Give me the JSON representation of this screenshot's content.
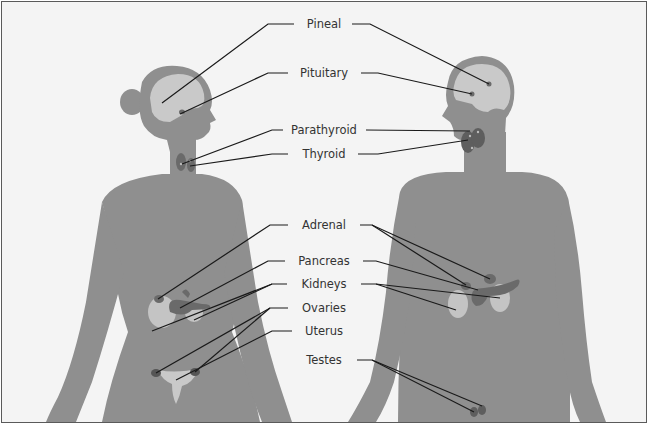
{
  "diagram": {
    "colors": {
      "background": "#f4f4f4",
      "body": "#8f8f8f",
      "brain": "#c9c9c9",
      "organ_dark": "#6a6a6a",
      "kidney": "#c4c4c4",
      "leader_line": "#1a1a1a",
      "label_text": "#333333",
      "border": "#5a5a5a"
    },
    "figures": [
      {
        "id": "female",
        "side": "left"
      },
      {
        "id": "male",
        "side": "right"
      }
    ],
    "labels": [
      {
        "id": "pineal",
        "text": "Pineal",
        "x": 322,
        "y": 21
      },
      {
        "id": "pituitary",
        "text": "Pituitary",
        "x": 322,
        "y": 70
      },
      {
        "id": "parathyroid",
        "text": "Parathyroid",
        "x": 322,
        "y": 122
      },
      {
        "id": "thyroid",
        "text": "Thyroid",
        "x": 322,
        "y": 145
      },
      {
        "id": "adrenal",
        "text": "Adrenal",
        "x": 322,
        "y": 217
      },
      {
        "id": "pancreas",
        "text": "Pancreas",
        "x": 322,
        "y": 252
      },
      {
        "id": "kidneys",
        "text": "Kidneys",
        "x": 322,
        "y": 276
      },
      {
        "id": "ovaries",
        "text": "Ovaries",
        "x": 322,
        "y": 299
      },
      {
        "id": "uterus",
        "text": "Uterus",
        "x": 322,
        "y": 322
      },
      {
        "id": "testes",
        "text": "Testes",
        "x": 322,
        "y": 351
      }
    ]
  }
}
